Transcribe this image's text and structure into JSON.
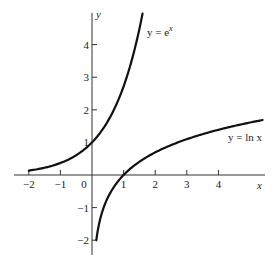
{
  "chart_data": {
    "type": "line",
    "title": "",
    "xlabel": "x",
    "ylabel": "y",
    "xlim": [
      -2.2,
      5.5
    ],
    "ylim": [
      -2.3,
      5.0
    ],
    "grid": false,
    "legend": "none (inline curve labels)",
    "x_ticks": [
      -2,
      -1,
      0,
      1,
      2,
      3,
      4
    ],
    "x_tick_labels": [
      "−2",
      "−1",
      "0",
      "1",
      "2",
      "3",
      "4"
    ],
    "y_ticks": [
      -2,
      -1,
      1,
      2,
      3,
      4
    ],
    "y_tick_labels": [
      "−2",
      "−1",
      "1",
      "2",
      "3",
      "4"
    ],
    "series": [
      {
        "name": "y = e^x",
        "label": "y = e",
        "label_sup": "x",
        "x": [
          -2,
          -1.5,
          -1,
          -0.5,
          0,
          0.5,
          1,
          1.25,
          1.5,
          1.6
        ],
        "y": [
          0.135,
          0.223,
          0.368,
          0.607,
          1,
          1.649,
          2.718,
          3.49,
          4.48,
          4.95
        ]
      },
      {
        "name": "y = ln x",
        "label": "y = ln x",
        "x": [
          0.135,
          0.2,
          0.3,
          0.5,
          0.75,
          1,
          1.5,
          2,
          3,
          4,
          5,
          5.4
        ],
        "y": [
          -2,
          -1.609,
          -1.204,
          -0.693,
          -0.288,
          0,
          0.405,
          0.693,
          1.099,
          1.386,
          1.609,
          1.686
        ]
      }
    ],
    "annotations": [
      "y = e^x near top of exponential curve",
      "y = ln x below right end of logarithm curve"
    ]
  }
}
